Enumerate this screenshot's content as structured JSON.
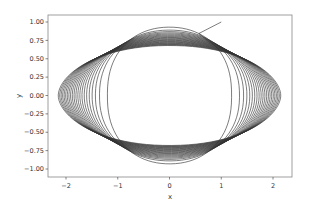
{
  "chart_data": {
    "type": "line",
    "title": "",
    "xlabel": "x",
    "ylabel": "y",
    "xlim": [
      -2.35,
      2.35
    ],
    "ylim": [
      -1.1,
      1.1
    ],
    "xticks": [
      -2,
      -1,
      0,
      1,
      2
    ],
    "xtick_labels": [
      "−2",
      "−1",
      "0",
      "1",
      "2"
    ],
    "yticks": [
      1.0,
      0.75,
      0.5,
      0.25,
      0.0,
      -0.25,
      -0.5,
      -0.75,
      -1.0
    ],
    "ytick_labels": [
      "1.00",
      "0.75",
      "0.50",
      "0.25",
      "0.00",
      "−0.25",
      "−0.50",
      "−0.75",
      "−1.00"
    ],
    "grid": false,
    "legend": null,
    "line_color": "#333333",
    "series": [
      {
        "name": "trajectory",
        "description": "Single continuous trajectory starting near (1.0, 1.0) forming a family of nested ellipses; first loop near-circular (|x|≈1.2, |y|≈0.93), later loops flatten, widening to |x|≈2.15 and |y|≈0.7, all crossing near (±1.2, ±0.6).",
        "start_point": [
          1.0,
          1.0
        ],
        "loops": 22,
        "semi_x_range": [
          1.2,
          2.15
        ],
        "semi_y_range": [
          0.93,
          0.68
        ]
      }
    ]
  }
}
